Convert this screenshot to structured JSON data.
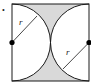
{
  "diagram": {
    "type": "geometry",
    "marker": "•",
    "labels": {
      "left_radius": "r",
      "right_radius": "r"
    },
    "colors": {
      "shade": "#d9d9d9",
      "stroke": "#1a1a1a",
      "background": "#ffffff"
    }
  }
}
